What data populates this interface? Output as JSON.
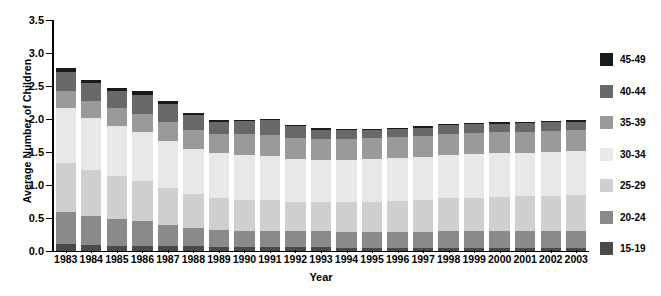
{
  "chart_data": {
    "type": "bar",
    "subtype": "stacked-bar",
    "title": "",
    "xlabel": "Year",
    "ylabel": "Average Number of Children",
    "ylim": [
      0.0,
      3.5
    ],
    "ytick_labels": [
      "0.0",
      "0.5",
      "1.0",
      "1.5",
      "2.0",
      "2.5",
      "3.0",
      "3.5"
    ],
    "ytick_values": [
      0.0,
      0.5,
      1.0,
      1.5,
      2.0,
      2.5,
      3.0,
      3.5
    ],
    "grid": false,
    "legend_position": "right",
    "categories": [
      "1983",
      "1984",
      "1985",
      "1986",
      "1987",
      "1988",
      "1989",
      "1990",
      "1991",
      "1992",
      "1993",
      "1994",
      "1995",
      "1996",
      "1997",
      "1998",
      "1999",
      "2000",
      "2001",
      "2002",
      "2003"
    ],
    "series": [
      {
        "name": "15-19",
        "color": "#4a4a4a",
        "values": [
          0.1,
          0.09,
          0.08,
          0.08,
          0.07,
          0.07,
          0.06,
          0.06,
          0.06,
          0.06,
          0.06,
          0.05,
          0.05,
          0.05,
          0.05,
          0.05,
          0.05,
          0.05,
          0.05,
          0.05,
          0.05
        ]
      },
      {
        "name": "20-24",
        "color": "#8a8a8a",
        "values": [
          0.49,
          0.44,
          0.4,
          0.38,
          0.33,
          0.28,
          0.26,
          0.25,
          0.25,
          0.25,
          0.24,
          0.24,
          0.24,
          0.24,
          0.24,
          0.25,
          0.25,
          0.25,
          0.25,
          0.25,
          0.25
        ]
      },
      {
        "name": "25-29",
        "color": "#cfcfcf",
        "values": [
          0.75,
          0.7,
          0.66,
          0.6,
          0.55,
          0.51,
          0.48,
          0.47,
          0.46,
          0.44,
          0.44,
          0.45,
          0.46,
          0.47,
          0.48,
          0.5,
          0.51,
          0.52,
          0.53,
          0.54,
          0.55
        ]
      },
      {
        "name": "30-34",
        "color": "#e8e8e8",
        "values": [
          0.83,
          0.79,
          0.76,
          0.74,
          0.72,
          0.69,
          0.68,
          0.68,
          0.67,
          0.65,
          0.64,
          0.64,
          0.64,
          0.65,
          0.65,
          0.66,
          0.66,
          0.66,
          0.66,
          0.66,
          0.66
        ]
      },
      {
        "name": "35-39",
        "color": "#9a9a9a",
        "values": [
          0.25,
          0.25,
          0.26,
          0.27,
          0.28,
          0.29,
          0.3,
          0.31,
          0.32,
          0.32,
          0.32,
          0.32,
          0.32,
          0.32,
          0.32,
          0.32,
          0.32,
          0.32,
          0.32,
          0.32,
          0.32
        ]
      },
      {
        "name": "40-44",
        "color": "#686868",
        "values": [
          0.29,
          0.27,
          0.27,
          0.3,
          0.28,
          0.22,
          0.18,
          0.2,
          0.22,
          0.17,
          0.14,
          0.13,
          0.12,
          0.12,
          0.13,
          0.13,
          0.13,
          0.13,
          0.13,
          0.13,
          0.13
        ]
      },
      {
        "name": "45-49",
        "color": "#1a1a1a",
        "values": [
          0.07,
          0.05,
          0.04,
          0.05,
          0.04,
          0.03,
          0.02,
          0.02,
          0.02,
          0.02,
          0.02,
          0.02,
          0.02,
          0.02,
          0.02,
          0.02,
          0.02,
          0.02,
          0.02,
          0.02,
          0.02
        ]
      }
    ],
    "totals": [
      2.78,
      2.59,
      2.47,
      2.42,
      2.27,
      2.09,
      1.98,
      1.99,
      2.0,
      1.91,
      1.86,
      1.85,
      1.85,
      1.87,
      1.89,
      1.93,
      1.94,
      1.95,
      1.96,
      1.97,
      1.98
    ]
  },
  "legend": {
    "items": [
      {
        "label": "45-49",
        "color": "#1a1a1a"
      },
      {
        "label": "40-44",
        "color": "#686868"
      },
      {
        "label": "35-39",
        "color": "#9a9a9a"
      },
      {
        "label": "30-34",
        "color": "#e8e8e8"
      },
      {
        "label": "25-29",
        "color": "#cfcfcf"
      },
      {
        "label": "20-24",
        "color": "#8a8a8a"
      },
      {
        "label": "15-19",
        "color": "#4a4a4a"
      }
    ]
  },
  "axes": {
    "y_title": "Average Number of Children",
    "x_title": "Year"
  }
}
